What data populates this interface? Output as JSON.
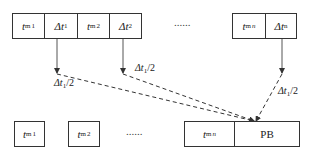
{
  "diagram": {
    "top_row": {
      "group1": [
        {
          "base": "t",
          "sub": "m",
          "sup": "1",
          "kind": "time"
        },
        {
          "base": "Δt",
          "sub": "1",
          "kind": "delta"
        },
        {
          "base": "t",
          "sub": "m",
          "sup": "2",
          "kind": "time"
        },
        {
          "base": "Δt",
          "sub": "2",
          "kind": "delta"
        }
      ],
      "ellipsis": "......",
      "group_n": [
        {
          "base": "t",
          "sub": "m",
          "sup": "n",
          "kind": "time"
        },
        {
          "base": "Δt",
          "sub": "n",
          "kind": "delta"
        }
      ]
    },
    "bottom_row": {
      "box1": {
        "base": "t",
        "sub": "m",
        "sup": "1"
      },
      "box2": {
        "base": "t",
        "sub": "m",
        "sup": "2"
      },
      "ellipsis": "......",
      "group_n": {
        "time": {
          "base": "t",
          "sub": "m",
          "sup": "n"
        },
        "pb_label": "PB"
      }
    },
    "arrow_labels": [
      {
        "base": "Δt",
        "sub": "1",
        "tail": "/2"
      },
      {
        "base": "Δt",
        "sub": "1",
        "tail": "/2"
      },
      {
        "base": "Δt",
        "sub": "1",
        "tail": "/2"
      }
    ],
    "colors": {
      "line": "#333333",
      "background": "#ffffff"
    }
  }
}
